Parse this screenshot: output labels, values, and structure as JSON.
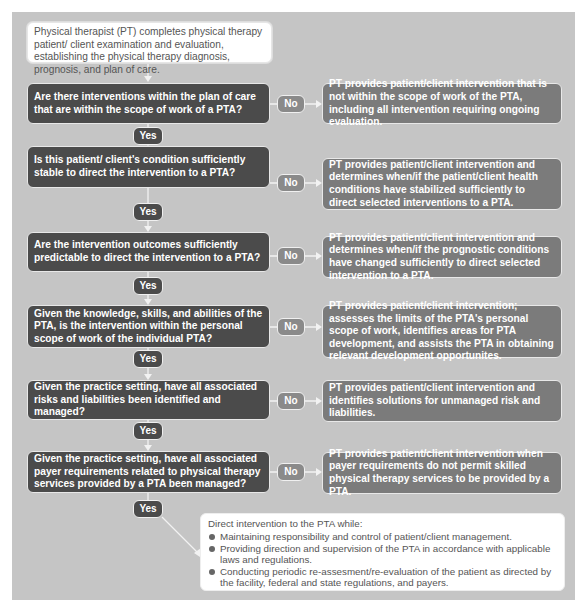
{
  "diagram": {
    "start": "Physical therapist (PT) completes physical therapy patient/ client examination and evaluation, establishing the physical therapy diagnosis, prognosis, and plan of care.",
    "yes_label": "Yes",
    "no_label": "No",
    "steps": [
      {
        "question": "Are there interventions within the plan of care that are within the scope of work of a PTA?",
        "no_outcome": "PT provides patient/client intervention that is not within the scope of work of the PTA, including all intervention requiring ongoing evaluation."
      },
      {
        "question": "Is this patient/ client's condition sufficiently stable to direct the intervention to a PTA?",
        "no_outcome": "PT provides patient/client intervention and determines when/if the patient/client health conditions have stabilized sufficiently to direct selected interventions to a PTA."
      },
      {
        "question": "Are the intervention outcomes sufficiently predictable to direct the intervention to a PTA?",
        "no_outcome": "PT provides patient/client intervention and determines when/if the prognostic conditions have changed sufficiently to direct selected intervention to a PTA."
      },
      {
        "question": "Given the knowledge, skills, and abilities of the PTA, is the intervention within the personal scope of work of the individual PTA?",
        "no_outcome": "PT provides patient/client intervention; assesses the limits of the PTA's personal scope of work, identifies areas for PTA development, and assists the PTA in obtaining relevant development opportunites."
      },
      {
        "question": "Given the practice setting, have all associated risks and liabilities been identified and managed?",
        "no_outcome": "PT provides patient/client intervention and identifies solutions for unmanaged risk and liabilities."
      },
      {
        "question": "Given the practice setting, have all associated payer requirements related to physical therapy services provided by a PTA been managed?",
        "no_outcome": "PT provides patient/client intervention when payer requirements do not permit skilled physical therapy services to be provided by a PTA."
      }
    ],
    "final": {
      "heading": "Direct intervention to the PTA while:",
      "bullets": [
        "Maintaining responsibility and control of patient/client management.",
        "Providing direction and supervision of the PTA in accordance with applicable laws and regulations.",
        "Conducting periodic re-assesment/re-evaluation of the patient as directed by the facility, federal and state regulations, and payers."
      ]
    }
  }
}
